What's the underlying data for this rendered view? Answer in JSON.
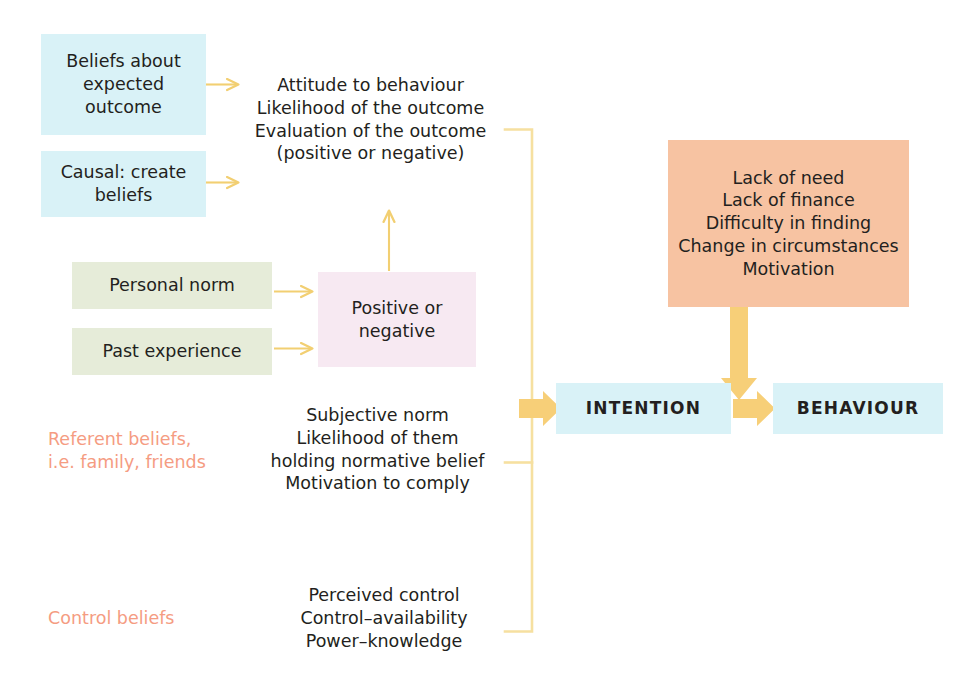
{
  "diagram": {
    "colors": {
      "blue": "#d9f2f7",
      "green": "#e6ecd9",
      "pink": "#f7e9f2",
      "orange": "#f7c3a2",
      "arrow": "#f7d98a",
      "arrow_thick": "#f7cf78",
      "bracket": "#f8e3a0",
      "text_dark": "#231f20",
      "text_salmon": "#f59c82"
    },
    "boxes": {
      "beliefs_expected_outcome": "Beliefs about\nexpected\noutcome",
      "causal_create_beliefs": "Causal: create\nbeliefs",
      "personal_norm": "Personal norm",
      "past_experience": "Past experience",
      "positive_or_negative": "Positive or\nnegative",
      "barriers": "Lack of need\nLack of finance\nDifficulty in finding\nChange in circumstances\nMotivation",
      "intention": "INTENTION",
      "behaviour": "BEHAVIOUR"
    },
    "labels": {
      "attitude_block": "Attitude to behaviour\nLikelihood of the outcome\nEvaluation of the outcome\n(positive or negative)",
      "referent_beliefs": "Referent beliefs,\ni.e. family, friends",
      "subjective_norm_block": "Subjective norm\nLikelihood of them\nholding normative belief\nMotivation to comply",
      "control_beliefs": "Control beliefs",
      "control_block": "Perceived control\nControl–availability\nPower–knowledge"
    },
    "connectors": [
      {
        "name": "arrow-beliefs-to-attitude",
        "kind": "thin-arrow-right"
      },
      {
        "name": "arrow-causal-to-attitude",
        "kind": "thin-arrow-right"
      },
      {
        "name": "arrow-personal-norm-to-positive",
        "kind": "thin-arrow-right"
      },
      {
        "name": "arrow-past-experience-to-positive",
        "kind": "thin-arrow-right"
      },
      {
        "name": "arrow-positive-to-attitude",
        "kind": "thin-arrow-up"
      },
      {
        "name": "bracket-determinants",
        "kind": "bracket"
      },
      {
        "name": "arrow-bracket-to-intention",
        "kind": "thick-arrow-right"
      },
      {
        "name": "arrow-intention-to-behaviour",
        "kind": "thick-arrow-right"
      },
      {
        "name": "arrow-barriers-to-behaviour",
        "kind": "thick-arrow-down"
      }
    ]
  }
}
